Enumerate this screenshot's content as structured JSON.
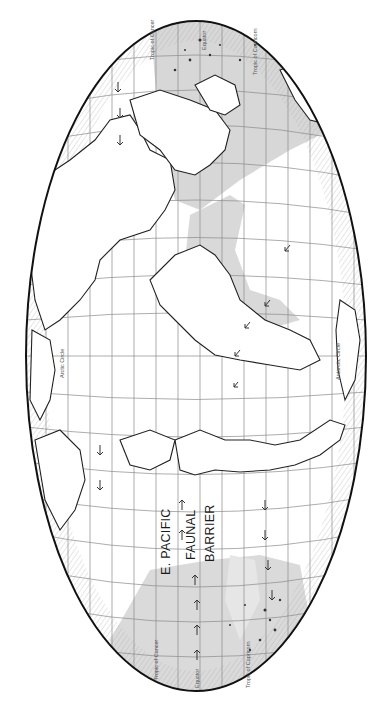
{
  "map": {
    "projection": "equal-area ellipse (rotated 90°)",
    "rotation_deg": -90,
    "colors": {
      "background": "#ffffff",
      "ocean": "#ffffff",
      "shaded_region": "#d9d9d9",
      "coastline": "#222222",
      "graticule": "#888888",
      "outline": "#111111",
      "arrow": "#333333"
    },
    "labels": {
      "barrier_line1": "E. PACIFIC",
      "barrier_line2": "FAUNAL",
      "barrier_line3": "BARRIER",
      "tropic_cancer_top": "Tropic of Cancer",
      "tropic_cancer_bottom": "Tropic of Cancer",
      "equator_top": "Equator",
      "equator_bottom": "Equator",
      "tropic_capricorn_top": "Tropic of Capricorn",
      "tropic_capricorn_bottom": "Tropic of Capricorn",
      "arctic_circle": "Arctic Circle",
      "antarctic_circle": "Antarctic Circle"
    },
    "regions": [
      {
        "name": "Indo-West Pacific shaded region",
        "position": "top"
      },
      {
        "name": "Western Atlantic shaded region",
        "position": "center-right"
      },
      {
        "name": "Central Pacific shaded region",
        "position": "bottom"
      }
    ],
    "arrows_description": "Small arrows indicating dispersal / current direction across the Pacific and Atlantic"
  }
}
